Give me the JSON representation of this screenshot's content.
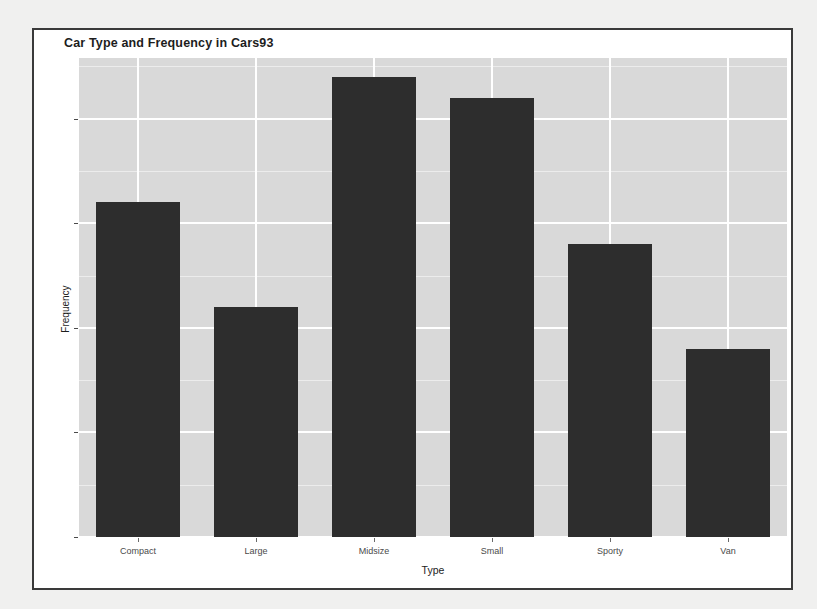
{
  "window": {
    "background_color": "#f0f0ef",
    "frame_border_color": "#3a3a3a"
  },
  "chart_data": {
    "type": "bar",
    "title": "Car Type and Frequency in Cars93",
    "xlabel": "Type",
    "ylabel": "Frequency",
    "categories": [
      "Compact",
      "Large",
      "Midsize",
      "Small",
      "Sporty",
      "Van"
    ],
    "values": [
      16,
      11,
      22,
      21,
      14,
      9
    ],
    "ylim": [
      0,
      22.9
    ],
    "y_ticks": [
      0,
      5,
      10,
      15,
      20
    ],
    "y_tick_labels": [
      "0",
      "5",
      "10",
      "15",
      "20"
    ],
    "y_minor_ticks": [
      2.5,
      7.5,
      12.5,
      17.5,
      22.5
    ],
    "grid": true,
    "legend": "none",
    "bar_color": "#2d2d2d",
    "panel_background": "#d9d9d9",
    "grid_color": "#ffffff",
    "axis_text_color": "#4a4a4a"
  }
}
